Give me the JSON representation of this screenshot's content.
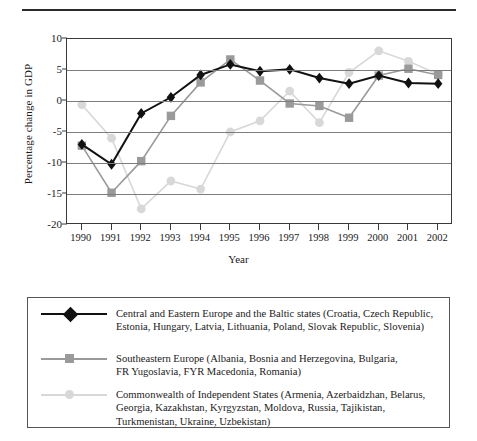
{
  "divider": {
    "name": "top-rule"
  },
  "chart_data": {
    "type": "line",
    "title": "",
    "xlabel": "Year",
    "ylabel": "Percentage change in GDP",
    "grid": true,
    "legend_position": "below-plot-boxed",
    "x": [
      1990,
      1991,
      1992,
      1993,
      1994,
      1995,
      1996,
      1997,
      1998,
      1999,
      2000,
      2001,
      2002
    ],
    "xtick_labels": [
      "1990",
      "1991",
      "1992",
      "1993",
      "1994",
      "1995",
      "1996",
      "1997",
      "1998",
      "1999",
      "2000",
      "2001",
      "2002"
    ],
    "ylim": [
      -20,
      10
    ],
    "ytick_labels": [
      "10",
      "5",
      "0",
      "-5",
      "-10",
      "-15",
      "-20"
    ],
    "yticks": [
      10,
      5,
      0,
      -5,
      -10,
      -15,
      -20
    ],
    "series": [
      {
        "name": "Central and Eastern Europe and the Baltic states",
        "marker": "diamond",
        "color": "#111111",
        "values": [
          -7.0,
          -10.2,
          -2.0,
          0.6,
          4.2,
          5.9,
          4.8,
          5.1,
          3.7,
          2.8,
          4.1,
          2.9,
          2.8
        ]
      },
      {
        "name": "Southeastern Europe",
        "marker": "square",
        "color": "#9a9a9a",
        "values": [
          -7.2,
          -14.8,
          -9.7,
          -2.4,
          3.0,
          6.7,
          3.3,
          -0.4,
          -0.8,
          -2.7,
          4.1,
          5.2,
          4.2
        ]
      },
      {
        "name": "Commonwealth of Independent States",
        "marker": "circle",
        "color": "#d8d8d8",
        "values": [
          -0.6,
          -6.0,
          -17.4,
          -12.9,
          -14.2,
          -5.0,
          -3.2,
          1.6,
          -3.5,
          4.6,
          8.1,
          6.4,
          4.3
        ]
      }
    ]
  },
  "legend": {
    "entries": [
      {
        "marker": "diamond",
        "color": "#111111",
        "marker_name": "black-diamond-marker",
        "label": "Central and Eastern Europe and the Baltic states (Croatia, Czech Republic,\nEstonia, Hungary, Latvia, Lithuania, Poland, Slovak Republic, Slovenia)"
      },
      {
        "marker": "square",
        "color": "#9a9a9a",
        "marker_name": "gray-square-marker",
        "label": "Southeastern Europe (Albania, Bosnia and Herzegovina, Bulgaria,\nFR Yugoslavia, FYR Macedonia, Romania)"
      },
      {
        "marker": "circle",
        "color": "#d8d8d8",
        "marker_name": "light-gray-circle-marker",
        "label": "Commonwealth of Independent States (Armenia, Azerbaidzhan, Belarus,\nGeorgia, Kazakhstan, Kyrgyzstan, Moldova, Russia, Tajikistan,\nTurkmenistan, Ukraine, Uzbekistan)"
      }
    ]
  }
}
